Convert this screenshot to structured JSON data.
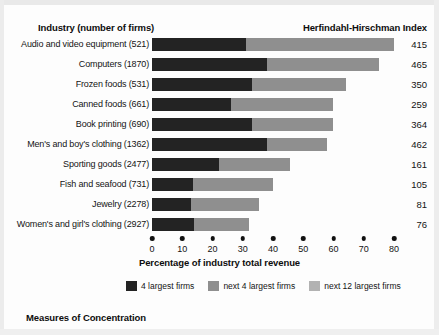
{
  "header": {
    "left_title": "Industry (number of firms)",
    "right_title": "Herfindahl-Hirschman Index"
  },
  "caption": "Measures of Concentration",
  "axis": {
    "title": "Percentage of industry total revenue",
    "ticks": [
      "0",
      "10",
      "20",
      "30",
      "40",
      "50",
      "60",
      "70",
      "80"
    ],
    "min": 0,
    "max": 80
  },
  "legend": [
    {
      "label": "4 largest firms",
      "color": "#232323"
    },
    {
      "label": "next 4 largest firms",
      "color": "#8f8f8f"
    },
    {
      "label": "next 12 largest firms",
      "color": "#b2b2b2"
    }
  ],
  "rows": [
    {
      "label": "Audio and video equipment  (521)",
      "hhi": "415"
    },
    {
      "label": "Computers  (1870)",
      "hhi": "465"
    },
    {
      "label": "Frozen foods  (531)",
      "hhi": "350"
    },
    {
      "label": "Canned foods  (661)",
      "hhi": "259"
    },
    {
      "label": "Book printing  (690)",
      "hhi": "364"
    },
    {
      "label": "Men's and boy's clothing  (1362)",
      "hhi": "462"
    },
    {
      "label": "Sporting goods  (2477)",
      "hhi": "161"
    },
    {
      "label": "Fish and seafood  (731)",
      "hhi": "105"
    },
    {
      "label": "Jewelry  (2278)",
      "hhi": "81"
    },
    {
      "label": "Women's and girl's clothing  (2927)",
      "hhi": "76"
    }
  ],
  "chart_data": {
    "type": "bar",
    "orientation": "horizontal",
    "stacked": true,
    "title": "Measures of Concentration",
    "xlabel": "Percentage of industry total revenue",
    "ylabel": "Industry (number of firms)",
    "xlim": [
      0,
      80
    ],
    "xticks": [
      0,
      10,
      20,
      30,
      40,
      50,
      60,
      70,
      80
    ],
    "grid": false,
    "legend_position": "bottom",
    "categories": [
      "Audio and video equipment (521)",
      "Computers (1870)",
      "Frozen foods (531)",
      "Canned foods (661)",
      "Book printing (690)",
      "Men's and boy's clothing (1362)",
      "Sporting goods (2477)",
      "Fish and seafood (731)",
      "Jewelry (2278)",
      "Women's and girl's clothing (2927)"
    ],
    "number_of_firms": [
      521,
      1870,
      531,
      661,
      690,
      1362,
      2477,
      731,
      2278,
      2927
    ],
    "series": [
      {
        "name": "4 largest firms",
        "color": "#232323",
        "values": [
          31,
          38,
          33,
          26,
          33,
          38,
          22,
          13.5,
          13,
          14
        ]
      },
      {
        "name": "next 4 largest firms",
        "color": "#8f8f8f",
        "values": [
          49,
          37,
          31,
          34,
          27,
          20,
          23.5,
          26.5,
          22.5,
          18
        ]
      }
    ],
    "totals": [
      80,
      75,
      64,
      60,
      60,
      58,
      45.5,
      40,
      35.5,
      32
    ],
    "annotations": {
      "name": "Herfindahl-Hirschman Index",
      "values": [
        415,
        465,
        350,
        259,
        364,
        462,
        161,
        105,
        81,
        76
      ]
    }
  }
}
